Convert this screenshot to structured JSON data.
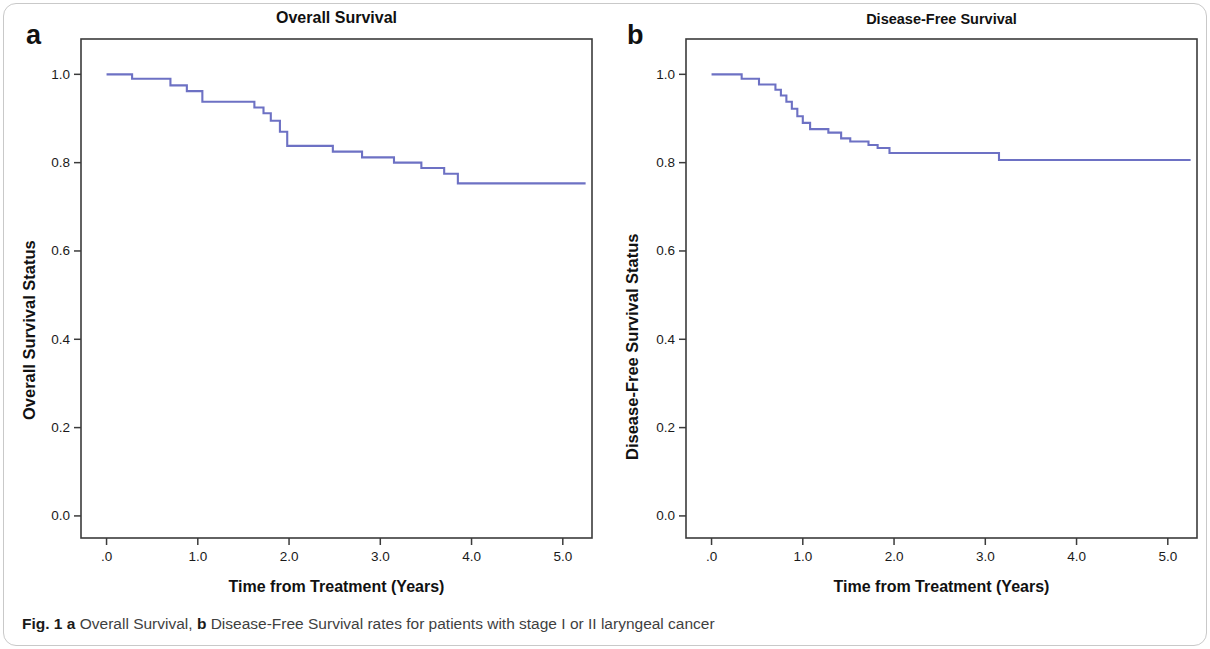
{
  "figure": {
    "caption_label": "Fig. 1",
    "caption_a_marker": "a",
    "caption_a_text": "Overall Survival,",
    "caption_b_marker": "b",
    "caption_b_text": "Disease-Free Survival rates for patients with stage I or II laryngeal cancer",
    "line_color": "#6d71c4",
    "axis_color": "#3b3b3b",
    "text_color": "#111111"
  },
  "panels": [
    {
      "letter": "a",
      "title": "Overall Survival",
      "ylabel": "Overall Survival Status",
      "xlabel": "Time from Treatment (Years)"
    },
    {
      "letter": "b",
      "title": "Disease-Free Survival",
      "ylabel": "Disease-Free Survival Status",
      "xlabel": "Time from Treatment (Years)"
    }
  ],
  "chart_data": [
    {
      "type": "line",
      "subplot": "a",
      "title": "Overall Survival",
      "xlabel": "Time from Treatment (Years)",
      "ylabel": "Overall Survival Status",
      "xlim": [
        -0.28,
        5.32
      ],
      "ylim": [
        -0.05,
        1.08
      ],
      "xticks": [
        0,
        1,
        2,
        3,
        4,
        5
      ],
      "xticklabels": [
        ".0",
        "1.0",
        "2.0",
        "3.0",
        "4.0",
        "5.0"
      ],
      "yticks": [
        0.0,
        0.2,
        0.4,
        0.6,
        0.8,
        1.0
      ],
      "yticklabels": [
        "0.0",
        "0.2",
        "0.4",
        "0.6",
        "0.8",
        "1.0"
      ],
      "grid": false,
      "legend": false,
      "step_style": "post",
      "x": [
        0.0,
        0.22,
        0.28,
        0.62,
        0.7,
        0.8,
        0.88,
        0.96,
        1.05,
        1.22,
        1.55,
        1.62,
        1.72,
        1.8,
        1.9,
        1.98,
        2.38,
        2.48,
        2.72,
        2.8,
        3.05,
        3.15,
        3.35,
        3.45,
        3.62,
        3.7,
        3.85,
        5.25
      ],
      "y": [
        1.0,
        1.0,
        0.99,
        0.99,
        0.975,
        0.975,
        0.962,
        0.962,
        0.938,
        0.938,
        0.938,
        0.925,
        0.912,
        0.895,
        0.87,
        0.838,
        0.838,
        0.825,
        0.825,
        0.812,
        0.812,
        0.8,
        0.8,
        0.788,
        0.788,
        0.775,
        0.753,
        0.753
      ],
      "final_value": 0.753
    },
    {
      "type": "line",
      "subplot": "b",
      "title": "Disease-Free Survival",
      "xlabel": "Time from Treatment (Years)",
      "ylabel": "Disease-Free Survival Status",
      "xlim": [
        -0.28,
        5.32
      ],
      "ylim": [
        -0.05,
        1.08
      ],
      "xticks": [
        0,
        1,
        2,
        3,
        4,
        5
      ],
      "xticklabels": [
        ".0",
        "1.0",
        "2.0",
        "3.0",
        "4.0",
        "5.0"
      ],
      "yticks": [
        0.0,
        0.2,
        0.4,
        0.6,
        0.8,
        1.0
      ],
      "yticklabels": [
        "0.0",
        "0.2",
        "0.4",
        "0.6",
        "0.8",
        "1.0"
      ],
      "grid": false,
      "legend": false,
      "step_style": "post",
      "x": [
        0.0,
        0.26,
        0.33,
        0.45,
        0.52,
        0.62,
        0.7,
        0.76,
        0.82,
        0.88,
        0.94,
        1.0,
        1.08,
        1.18,
        1.28,
        1.42,
        1.52,
        1.62,
        1.72,
        1.82,
        1.95,
        3.15,
        5.25
      ],
      "y": [
        1.0,
        1.0,
        0.99,
        0.99,
        0.977,
        0.977,
        0.965,
        0.952,
        0.938,
        0.922,
        0.905,
        0.89,
        0.876,
        0.876,
        0.868,
        0.855,
        0.848,
        0.848,
        0.84,
        0.833,
        0.822,
        0.806,
        0.806
      ],
      "final_value": 0.806
    }
  ]
}
